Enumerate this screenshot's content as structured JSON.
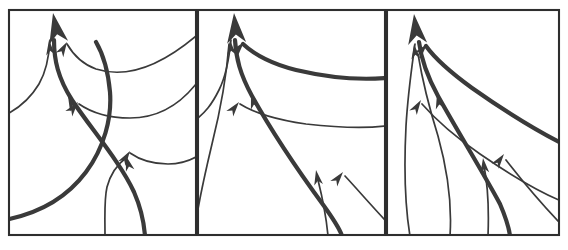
{
  "figure": {
    "kind": "streamline-convergence-diagram",
    "panel_count": 3,
    "background_color": "#ffffff",
    "line_color": "#3a3a3a",
    "frame_color": "#2e2e2e",
    "thick_stroke_width": 4.2,
    "thin_stroke_width": 1.7,
    "frame_stroke_width": 2.1,
    "caption": "",
    "title": "",
    "panels": [
      {
        "id": "panel-a",
        "label": "",
        "frame": {
          "x": 9,
          "y": 10,
          "width": 187,
          "height": 225
        },
        "description": "Strongly curved convergence: one bold streamline enters from the left border and sweeps up to a single exit arrow at the top; thin streamlines enter from the right border and from the bottom border.",
        "thick_streamlines": [
          {
            "id": "a-thick-main",
            "path": "M 54 40 C 54 60 58 78 72 100 C 92 130 120 162 134 192 C 141 208 144 222 145 236"
          },
          {
            "id": "a-thick-left",
            "path": "M 9 219 C 42 212 68 196 86 172 C 104 148 112 118 110 92 C 108 70 103 54 96 42"
          }
        ],
        "thin_streamlines": [
          {
            "id": "a-thin-1",
            "path": "M 50 40 C 49 58 46 72 39 84 C 30 99 20 107 9 113"
          },
          {
            "id": "a-thin-2",
            "path": "M 67 44 C 74 56 82 64 96 69 C 124 78 158 68 196 36"
          },
          {
            "id": "a-thin-3",
            "path": "M 79 104 C 92 113 108 118 130 118 C 160 118 180 104 196 84"
          },
          {
            "id": "a-thin-4",
            "path": "M 105 236 C 105 216 104 200 107 187 C 111 172 119 163 127 157"
          },
          {
            "id": "a-thin-5",
            "path": "M 130 153 C 140 160 152 164 168 164 C 180 164 189 161 196 157"
          }
        ],
        "arrowheads": [
          {
            "id": "a-arrow-main",
            "kind": "large-exit-arrow",
            "x": 53,
            "y": 13,
            "angle": -11,
            "length": 30,
            "halfwidth": 9.5
          },
          {
            "id": "a-arrow-thin-1",
            "kind": "small-arrow",
            "x": 49,
            "y": 40,
            "angle": -6,
            "length": 15,
            "halfwidth": 4.4
          },
          {
            "id": "a-arrow-thin-2",
            "kind": "small-arrow",
            "x": 67,
            "y": 42,
            "angle": 30,
            "length": 15,
            "halfwidth": 4.4
          },
          {
            "id": "a-arrow-thin-3",
            "kind": "small-arrow",
            "x": 78,
            "y": 102,
            "angle": 38,
            "length": 15,
            "halfwidth": 4.4
          },
          {
            "id": "a-arrow-thick-mid",
            "kind": "small-arrow",
            "x": 68,
            "y": 96,
            "angle": -24,
            "length": 15,
            "halfwidth": 4.4
          },
          {
            "id": "a-arrow-thin-4",
            "kind": "small-arrow",
            "x": 126,
            "y": 156,
            "angle": -16,
            "length": 15,
            "halfwidth": 4.4
          },
          {
            "id": "a-arrow-thin-5",
            "kind": "small-arrow",
            "x": 130,
            "y": 151,
            "angle": 33,
            "length": 15,
            "halfwidth": 4.4
          }
        ]
      },
      {
        "id": "panel-b",
        "label": "",
        "frame": {
          "x": 198,
          "y": 10,
          "width": 187,
          "height": 225
        },
        "description": "Intermediate convergence: bold streamline runs from bottom-right up to the top exit arrow; thin streamlines fan in from the right border, the left border and the bottom border.",
        "thick_streamlines": [
          {
            "id": "b-thick-main",
            "path": "M 235 40 C 236 58 240 74 252 96 C 272 132 302 176 324 206 C 334 220 340 229 342 236"
          },
          {
            "id": "b-thick-fan",
            "path": "M 243 44 C 256 56 272 64 296 70 C 330 78 360 80 385 78"
          }
        ],
        "thin_streamlines": [
          {
            "id": "b-thin-1",
            "path": "M 231 40 C 229 60 226 76 219 90 C 211 106 205 112 198 118"
          },
          {
            "id": "b-thin-2",
            "path": "M 240 104 C 256 114 278 120 306 124 C 342 128 368 128 385 126"
          },
          {
            "id": "b-thin-3",
            "path": "M 229 44 C 227 70 222 104 212 144 C 202 186 196 216 194 236"
          },
          {
            "id": "b-thin-4",
            "path": "M 318 180 C 322 196 326 214 328 236"
          },
          {
            "id": "b-thin-5",
            "path": "M 345 176 C 358 190 370 204 385 220"
          }
        ],
        "arrowheads": [
          {
            "id": "b-arrow-main",
            "kind": "large-exit-arrow",
            "x": 234,
            "y": 13,
            "angle": -5,
            "length": 30,
            "halfwidth": 9.5
          },
          {
            "id": "b-arrow-thin-1",
            "kind": "small-arrow",
            "x": 230,
            "y": 40,
            "angle": -6,
            "length": 15,
            "halfwidth": 4.4
          },
          {
            "id": "b-arrow-fan",
            "kind": "small-arrow",
            "x": 244,
            "y": 42,
            "angle": 40,
            "length": 15,
            "halfwidth": 4.4
          },
          {
            "id": "b-arrow-thin-2",
            "kind": "small-arrow",
            "x": 239,
            "y": 102,
            "angle": 38,
            "length": 15,
            "halfwidth": 4.4
          },
          {
            "id": "b-arrow-thick-mid",
            "kind": "small-arrow",
            "x": 251,
            "y": 94,
            "angle": -16,
            "length": 15,
            "halfwidth": 4.4
          },
          {
            "id": "b-arrow-thin-4",
            "kind": "small-arrow",
            "x": 316,
            "y": 170,
            "angle": -10,
            "length": 15,
            "halfwidth": 4.4
          },
          {
            "id": "b-arrow-thin-5",
            "kind": "small-arrow",
            "x": 343,
            "y": 172,
            "angle": 38,
            "length": 15,
            "halfwidth": 4.4
          }
        ]
      },
      {
        "id": "panel-c",
        "label": "",
        "frame": {
          "x": 387,
          "y": 10,
          "width": 172,
          "height": 225
        },
        "description": "Weak convergence: a tight bundle of nearly parallel streamlines rises from the bottom border and bends toward the single top exit arrow; the bold streamline sits inside the bundle.",
        "thick_streamlines": [
          {
            "id": "c-thick-main",
            "path": "M 419 42 C 421 58 426 74 438 96 C 458 132 484 174 500 204 C 506 218 509 228 510 236"
          },
          {
            "id": "c-thick-fan",
            "path": "M 426 46 C 436 60 450 72 472 88 C 506 112 536 130 559 142"
          }
        ],
        "thin_streamlines": [
          {
            "id": "c-thin-1",
            "path": "M 415 44 C 412 66 408 92 406 126 C 404 166 405 206 410 236"
          },
          {
            "id": "c-thin-2",
            "path": "M 422 104 C 436 120 454 136 480 154 C 512 176 540 192 559 200"
          },
          {
            "id": "c-thin-3",
            "path": "M 418 54 C 422 78 428 104 438 136 C 448 172 452 206 450 236"
          },
          {
            "id": "c-thin-4",
            "path": "M 484 166 C 488 186 489 210 488 236"
          },
          {
            "id": "c-thin-5",
            "path": "M 506 160 C 520 178 538 200 559 222"
          }
        ],
        "arrowheads": [
          {
            "id": "c-arrow-main",
            "kind": "large-exit-arrow",
            "x": 414,
            "y": 14,
            "angle": -7,
            "length": 30,
            "halfwidth": 9.5
          },
          {
            "id": "c-arrow-thin-1",
            "kind": "small-arrow",
            "x": 414,
            "y": 44,
            "angle": -7,
            "length": 15,
            "halfwidth": 4.4
          },
          {
            "id": "c-arrow-fan",
            "kind": "small-arrow",
            "x": 427,
            "y": 44,
            "angle": 40,
            "length": 15,
            "halfwidth": 4.4
          },
          {
            "id": "c-arrow-thin-3",
            "kind": "small-arrow",
            "x": 421,
            "y": 100,
            "angle": 32,
            "length": 15,
            "halfwidth": 4.4
          },
          {
            "id": "c-arrow-thick-mid",
            "kind": "small-arrow",
            "x": 437,
            "y": 94,
            "angle": -12,
            "length": 15,
            "halfwidth": 4.4
          },
          {
            "id": "c-arrow-thin-4",
            "kind": "small-arrow",
            "x": 483,
            "y": 158,
            "angle": -7,
            "length": 15,
            "halfwidth": 4.4
          },
          {
            "id": "c-arrow-thin-5",
            "kind": "small-arrow",
            "x": 504,
            "y": 154,
            "angle": 36,
            "length": 15,
            "halfwidth": 4.4
          }
        ]
      }
    ]
  }
}
